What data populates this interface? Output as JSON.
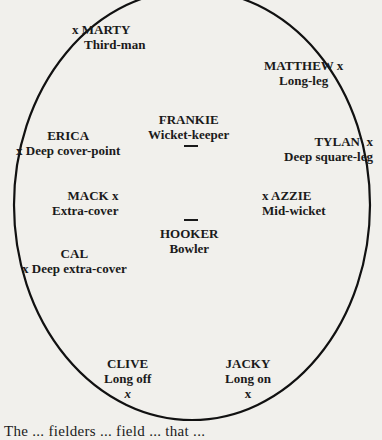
{
  "diagram": {
    "boundary": "oval",
    "fielders": [
      {
        "id": "marty",
        "name": "MARTY",
        "position": "Third-man"
      },
      {
        "id": "matthew",
        "name": "MATTHEW",
        "position": "Long-leg"
      },
      {
        "id": "erica",
        "name": "ERICA",
        "position": "Deep cover-point"
      },
      {
        "id": "frankie",
        "name": "FRANKIE",
        "position": "Wicket-keeper"
      },
      {
        "id": "tylan",
        "name": "TYLAN",
        "position": "Deep square-leg"
      },
      {
        "id": "mack",
        "name": "MACK",
        "position": "Extra-cover"
      },
      {
        "id": "azzie",
        "name": "AZZIE",
        "position": "Mid-wicket"
      },
      {
        "id": "hooker",
        "name": "HOOKER",
        "position": "Bowler"
      },
      {
        "id": "cal",
        "name": "CAL",
        "position": "Deep extra-cover"
      },
      {
        "id": "clive",
        "name": "CLIVE",
        "position": "Long off"
      },
      {
        "id": "jacky",
        "name": "JACKY",
        "position": "Long on"
      }
    ],
    "marker": "x"
  },
  "caption": {
    "text": "The ... fielders ... field ... that ..."
  }
}
